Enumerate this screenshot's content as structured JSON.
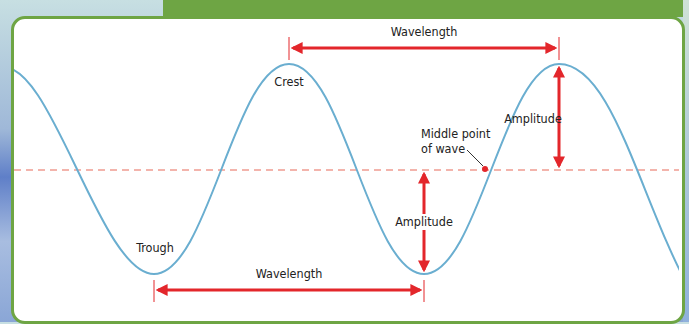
{
  "diagram": {
    "type": "wave-anatomy",
    "colors": {
      "frame_border": "#6ea544",
      "header_band": "#6ea544",
      "wave": "#6aaed0",
      "arrow": "#e3262b",
      "midline": "#e86a5a",
      "background": "#ffffff"
    },
    "labels": {
      "wavelength_top": "Wavelength",
      "wavelength_bottom": "Wavelength",
      "crest": "Crest",
      "trough": "Trough",
      "amplitude_right": "Amplitude",
      "amplitude_middle": "Amplitude",
      "middle_point_line1": "Middle point",
      "middle_point_line2": "of wave"
    }
  }
}
